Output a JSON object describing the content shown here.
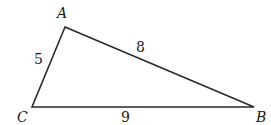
{
  "diagram": {
    "type": "triangle",
    "stroke_color": "#2a2a2a",
    "vertices": [
      {
        "name": "A",
        "x": 65,
        "y": 27,
        "label_x": 57,
        "label_y": 18
      },
      {
        "name": "B",
        "x": 254,
        "y": 107,
        "label_x": 256,
        "label_y": 122
      },
      {
        "name": "C",
        "x": 32,
        "y": 107,
        "label_x": 17,
        "label_y": 122
      }
    ],
    "sides": [
      {
        "between": "AC",
        "length": "5",
        "label_x": 34,
        "label_y": 64
      },
      {
        "between": "AB",
        "length": "8",
        "label_x": 136,
        "label_y": 52
      },
      {
        "between": "CB",
        "length": "9",
        "label_x": 121,
        "label_y": 122
      }
    ]
  }
}
